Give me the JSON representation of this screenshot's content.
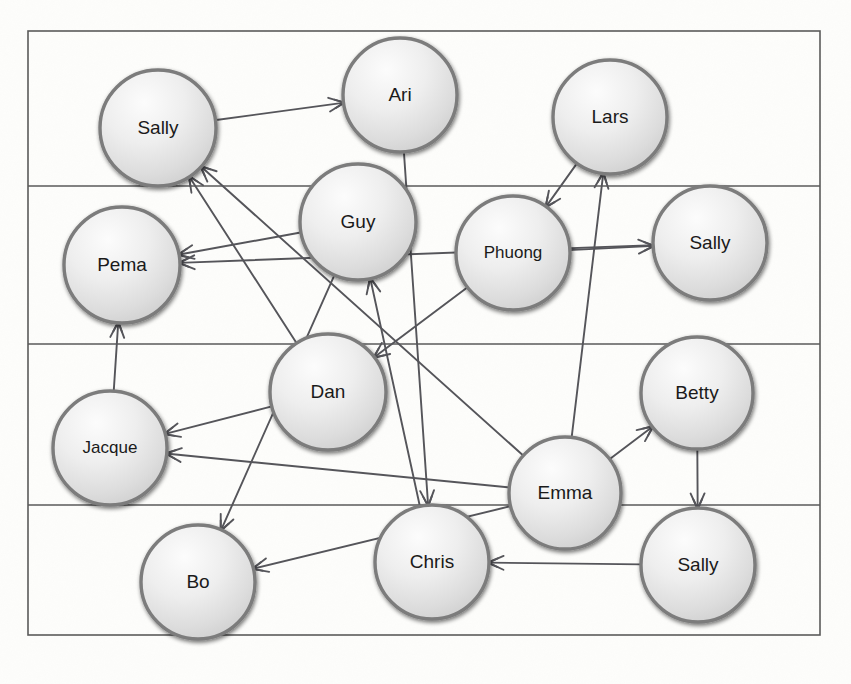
{
  "figure": {
    "kind": "directed-graph-diagram",
    "background_color": "#fdfdfb",
    "frame_color": "#5a5a5a",
    "edge_color": "#55555a",
    "node_fill": "#e3e3e3",
    "node_stroke": "#7b7b7b",
    "label_color": "#1a1a1a"
  },
  "frame": {
    "x": 28,
    "y": 31,
    "width": 792,
    "height": 604,
    "band_dividers_y": [
      186,
      344,
      505
    ]
  },
  "nodes": [
    {
      "id": "sally_tl",
      "label": "Sally",
      "cx": 158,
      "cy": 128,
      "r": 58,
      "font_size": 19
    },
    {
      "id": "ari",
      "label": "Ari",
      "cx": 400,
      "cy": 95,
      "r": 57,
      "font_size": 19
    },
    {
      "id": "lars",
      "label": "Lars",
      "cx": 610,
      "cy": 117,
      "r": 57,
      "font_size": 19
    },
    {
      "id": "pema",
      "label": "Pema",
      "cx": 122,
      "cy": 265,
      "r": 58,
      "font_size": 19
    },
    {
      "id": "guy",
      "label": "Guy",
      "cx": 358,
      "cy": 222,
      "r": 58,
      "font_size": 19
    },
    {
      "id": "phuong",
      "label": "Phuong",
      "cx": 513,
      "cy": 253,
      "r": 57,
      "font_size": 17
    },
    {
      "id": "sally_r",
      "label": "Sally",
      "cx": 710,
      "cy": 243,
      "r": 57,
      "font_size": 19
    },
    {
      "id": "dan",
      "label": "Dan",
      "cx": 328,
      "cy": 392,
      "r": 58,
      "font_size": 19
    },
    {
      "id": "betty",
      "label": "Betty",
      "cx": 697,
      "cy": 393,
      "r": 56,
      "font_size": 19
    },
    {
      "id": "jacque",
      "label": "Jacque",
      "cx": 110,
      "cy": 448,
      "r": 57,
      "font_size": 17
    },
    {
      "id": "emma",
      "label": "Emma",
      "cx": 565,
      "cy": 493,
      "r": 56,
      "font_size": 19
    },
    {
      "id": "bo",
      "label": "Bo",
      "cx": 198,
      "cy": 582,
      "r": 57,
      "font_size": 19
    },
    {
      "id": "chris",
      "label": "Chris",
      "cx": 432,
      "cy": 562,
      "r": 57,
      "font_size": 19
    },
    {
      "id": "sally_br",
      "label": "Sally",
      "cx": 698,
      "cy": 565,
      "r": 57,
      "font_size": 19
    }
  ],
  "edges": [
    {
      "from": "sally_tl",
      "to": "ari",
      "directed": true
    },
    {
      "from": "ari",
      "to": "chris",
      "directed": true
    },
    {
      "from": "lars",
      "to": "phuong",
      "directed": true
    },
    {
      "from": "phuong",
      "to": "sally_r",
      "directed": true
    },
    {
      "from": "emma",
      "to": "lars",
      "directed": true
    },
    {
      "from": "guy",
      "to": "pema",
      "directed": true
    },
    {
      "from": "sally_r",
      "to": "pema",
      "directed": true
    },
    {
      "from": "chris",
      "to": "guy",
      "directed": true
    },
    {
      "from": "phuong",
      "to": "dan",
      "directed": true
    },
    {
      "from": "dan",
      "to": "sally_tl",
      "directed": true
    },
    {
      "from": "dan",
      "to": "jacque",
      "directed": true
    },
    {
      "from": "emma",
      "to": "jacque",
      "directed": true
    },
    {
      "from": "jacque",
      "to": "pema",
      "directed": true
    },
    {
      "from": "guy",
      "to": "bo",
      "directed": true
    },
    {
      "from": "emma",
      "to": "bo",
      "directed": true
    },
    {
      "from": "emma",
      "to": "betty",
      "directed": true
    },
    {
      "from": "betty",
      "to": "sally_br",
      "directed": true
    },
    {
      "from": "sally_br",
      "to": "chris",
      "directed": true
    },
    {
      "from": "emma",
      "to": "sally_tl",
      "directed": true
    }
  ]
}
